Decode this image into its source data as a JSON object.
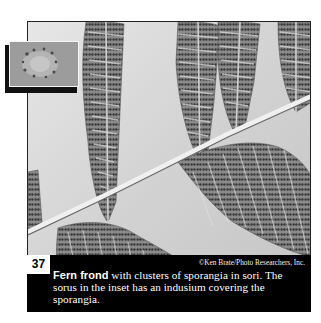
{
  "figure": {
    "number": "37",
    "credit": "©Ken Brate/Photo Researchers, Inc.",
    "caption_bold": "Fern frond",
    "caption_rest": " with clusters of sporangia in sori. The sorus in the inset has an indusium covering the sporangia.",
    "photo_subject": "Fern frond underside with sori (black-and-white photograph)",
    "inset_subject": "Close-up of a sorus with indusium"
  },
  "colors": {
    "caption_background": "#000000",
    "caption_text": "#ffffff",
    "frame_border": "#222222"
  }
}
